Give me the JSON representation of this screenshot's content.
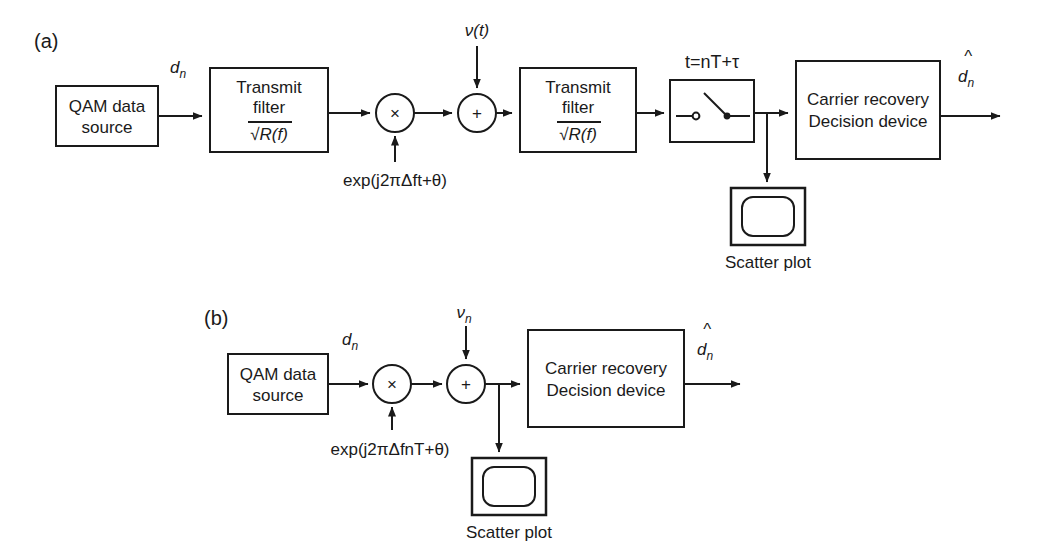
{
  "figure": {
    "background_color": "#ffffff",
    "line_color": "#1a1a1a",
    "panels": [
      {
        "id": "a",
        "label": "(a)",
        "blocks": [
          {
            "name": "qam-source",
            "line1": "QAM data",
            "line2": "source"
          },
          {
            "name": "transmit-filter-1",
            "line1": "Transmit",
            "line2": "filter",
            "line3": "√R(f)"
          },
          {
            "name": "multiplier",
            "symbol": "×"
          },
          {
            "name": "adder",
            "symbol": "+"
          },
          {
            "name": "transmit-filter-2",
            "line1": "Transmit",
            "line2": "filter",
            "line3": "√R(f)"
          },
          {
            "name": "sampler-switch",
            "label": "t=nT+τ"
          },
          {
            "name": "carrier-recovery",
            "line1": "Carrier recovery",
            "line2": "Decision device"
          },
          {
            "name": "scatter-plot",
            "caption": "Scatter plot"
          }
        ],
        "signals": {
          "input_symbol": "d",
          "input_subscript": "n",
          "noise": "ν(t)",
          "carrier_formula": "exp(j2πΔft+θ)",
          "sample_time": "t=nT+τ",
          "output_symbol": "d",
          "output_subscript": "n",
          "output_hat": "^"
        }
      },
      {
        "id": "b",
        "label": "(b)",
        "blocks": [
          {
            "name": "qam-source",
            "line1": "QAM data",
            "line2": "source"
          },
          {
            "name": "multiplier",
            "symbol": "×"
          },
          {
            "name": "adder",
            "symbol": "+"
          },
          {
            "name": "carrier-recovery",
            "line1": "Carrier recovery",
            "line2": "Decision device"
          },
          {
            "name": "scatter-plot",
            "caption": "Scatter plot"
          }
        ],
        "signals": {
          "input_symbol": "d",
          "input_subscript": "n",
          "noise_symbol": "ν",
          "noise_subscript": "n",
          "carrier_formula": "exp(j2πΔfnT+θ)",
          "output_symbol": "d",
          "output_subscript": "n",
          "output_hat": "^"
        }
      }
    ]
  },
  "text": {
    "panel_a_label": "(a)",
    "panel_b_label": "(b)",
    "qam_line1": "QAM data",
    "qam_line2": "source",
    "transmit_line1": "Transmit",
    "transmit_line2": "filter",
    "sqrt_rf": "√R(f)",
    "times_symbol": "×",
    "plus_symbol": "+",
    "sample_label": "t=nT+τ",
    "carrier_line1": "Carrier recovery",
    "carrier_line2": "Decision device",
    "scatter_caption": "Scatter plot",
    "noise_a": "ν(t)",
    "noise_b_symbol": "ν",
    "noise_b_sub": "n",
    "d_symbol": "d",
    "d_sub": "n",
    "hat": "^",
    "formula_a": "exp(j2πΔft+θ)",
    "formula_b": "exp(j2πΔfnT+θ)"
  }
}
